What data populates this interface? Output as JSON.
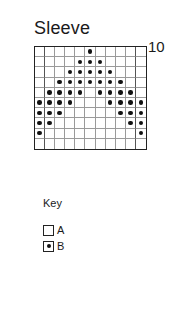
{
  "chart": {
    "title": "Sleeve",
    "row_label_top": "10",
    "columns": 11,
    "rows": 10,
    "colors": {
      "grid_line": "#9a9a9a",
      "border": "#222222",
      "dot": "#111111"
    },
    "pattern": [
      [
        0,
        0,
        0,
        0,
        0,
        1,
        0,
        0,
        0,
        0,
        0
      ],
      [
        0,
        0,
        0,
        0,
        1,
        1,
        1,
        0,
        0,
        0,
        0
      ],
      [
        0,
        0,
        0,
        1,
        1,
        1,
        1,
        1,
        0,
        0,
        0
      ],
      [
        0,
        0,
        1,
        1,
        1,
        1,
        1,
        1,
        1,
        0,
        0
      ],
      [
        0,
        1,
        1,
        1,
        1,
        0,
        1,
        1,
        1,
        1,
        0
      ],
      [
        1,
        1,
        1,
        1,
        0,
        0,
        0,
        1,
        1,
        1,
        1
      ],
      [
        1,
        1,
        1,
        0,
        0,
        0,
        0,
        0,
        1,
        1,
        1
      ],
      [
        1,
        1,
        0,
        0,
        0,
        0,
        0,
        0,
        0,
        1,
        1
      ],
      [
        1,
        0,
        0,
        0,
        0,
        0,
        0,
        0,
        0,
        0,
        1
      ],
      [
        0,
        0,
        0,
        0,
        0,
        0,
        0,
        0,
        0,
        0,
        0
      ]
    ],
    "separator_after_columns": [
      1,
      10
    ]
  },
  "key": {
    "title": "Key",
    "items": [
      {
        "symbol": "empty-square",
        "label": "A"
      },
      {
        "symbol": "dot-square",
        "label": "B"
      }
    ]
  }
}
